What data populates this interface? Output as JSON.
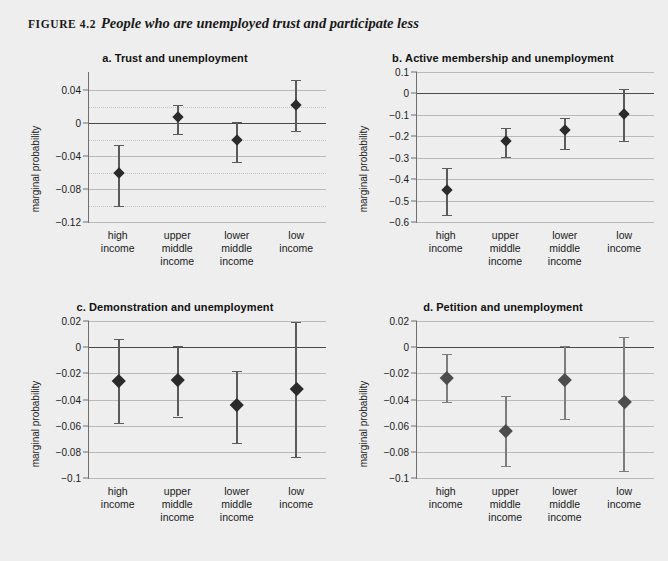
{
  "figure": {
    "label": "FIGURE 4.2",
    "title": "People who are unemployed trust and participate less"
  },
  "axis_title": "marginal probability",
  "categories": [
    "high income",
    "upper middle income",
    "lower middle income",
    "low income"
  ],
  "category_lines": [
    [
      "high",
      "income"
    ],
    [
      "upper",
      "middle",
      "income"
    ],
    [
      "lower",
      "middle",
      "income"
    ],
    [
      "low",
      "income"
    ]
  ],
  "colors": {
    "page_background": "#eeeeee",
    "marker": "#2b2b2b",
    "marker_light": "#4d4d4d",
    "whisker": "#5a5a5a",
    "whisker_light": "#7d7d7d",
    "gridline": "#b9b9b9",
    "zero_line": "#4a4a4a",
    "axis": "#6f6f6f",
    "text": "#1a1a1a"
  },
  "chart_data": [
    {
      "id": "a",
      "type": "scatter",
      "panel_letter": "a.",
      "title": "Trust and unemployment",
      "xlabel": "",
      "ylabel": "marginal probability",
      "categories": [
        "high income",
        "upper middle income",
        "lower middle income",
        "low income"
      ],
      "values": [
        -0.06,
        0.007,
        -0.021,
        0.022
      ],
      "ci_low": [
        -0.1,
        -0.013,
        -0.047,
        -0.009
      ],
      "ci_high": [
        -0.026,
        0.022,
        0.001,
        0.052
      ],
      "ylim": [
        -0.12,
        0.062
      ],
      "yticks": [
        0.04,
        0,
        -0.04,
        -0.08,
        -0.12
      ],
      "ytick_labels": [
        "0.04",
        "0",
        "−0.04",
        "−0.08",
        "−0.12"
      ],
      "minor_gridlines": [
        0.02,
        -0.02,
        -0.06,
        -0.1
      ],
      "grid": true,
      "zero_line": 0,
      "legend": "none"
    },
    {
      "id": "b",
      "type": "scatter",
      "panel_letter": "b.",
      "title": "Active membership and unemployment",
      "xlabel": "",
      "ylabel": "marginal probability",
      "categories": [
        "high income",
        "upper middle income",
        "lower middle income",
        "low income"
      ],
      "values": [
        -0.452,
        -0.223,
        -0.17,
        -0.098
      ],
      "ci_low": [
        -0.568,
        -0.297,
        -0.258,
        -0.224
      ],
      "ci_high": [
        -0.348,
        -0.161,
        -0.113,
        0.02
      ],
      "ylim": [
        -0.6,
        0.1
      ],
      "yticks": [
        0.1,
        0,
        -0.1,
        -0.2,
        -0.3,
        -0.4,
        -0.5,
        -0.6
      ],
      "ytick_labels": [
        "0.1",
        "0",
        "−0.1",
        "−0.2",
        "−0.3",
        "−0.4",
        "−0.5",
        "−0.6"
      ],
      "minor_gridlines": [],
      "grid": true,
      "zero_line": 0,
      "legend": "none"
    },
    {
      "id": "c",
      "type": "scatter",
      "panel_letter": "c.",
      "title": "Demonstration and unemployment",
      "xlabel": "",
      "ylabel": "marginal probability",
      "categories": [
        "high income",
        "upper middle income",
        "lower middle income",
        "low income"
      ],
      "values": [
        -0.026,
        -0.025,
        -0.044,
        -0.032
      ],
      "ci_low": [
        -0.058,
        -0.053,
        -0.073,
        -0.084
      ],
      "ci_high": [
        0.006,
        0.001,
        -0.018,
        0.019
      ],
      "ylim": [
        -0.1,
        0.02
      ],
      "yticks": [
        0.02,
        0,
        -0.02,
        -0.04,
        -0.06,
        -0.08,
        -0.1
      ],
      "ytick_labels": [
        "0.02",
        "0",
        "−0.02",
        "−0.04",
        "−0.06",
        "−0.08",
        "−0.1"
      ],
      "minor_gridlines": [],
      "grid": true,
      "zero_line": 0,
      "legend": "none"
    },
    {
      "id": "d",
      "type": "scatter",
      "panel_letter": "d.",
      "title": "Petition and unemployment",
      "xlabel": "",
      "ylabel": "marginal probability",
      "categories": [
        "high income",
        "upper middle income",
        "lower middle income",
        "low income"
      ],
      "values": [
        -0.023,
        -0.064,
        -0.025,
        -0.042
      ],
      "ci_low": [
        -0.042,
        -0.091,
        -0.055,
        -0.095
      ],
      "ci_high": [
        -0.005,
        -0.037,
        0.001,
        0.008
      ],
      "ylim": [
        -0.1,
        0.02
      ],
      "yticks": [
        0.02,
        0,
        -0.02,
        -0.04,
        -0.06,
        -0.08,
        -0.1
      ],
      "ytick_labels": [
        "0.02",
        "0",
        "−0.02",
        "−0.04",
        "−0.06",
        "−0.08",
        "−0.1"
      ],
      "minor_gridlines": [],
      "grid": true,
      "zero_line": 0,
      "legend": "none"
    }
  ]
}
